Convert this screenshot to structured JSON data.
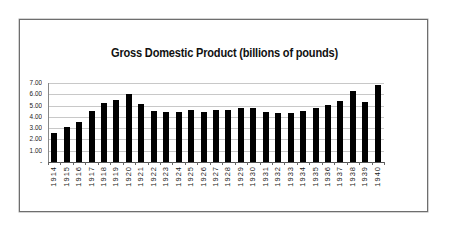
{
  "chart_data": {
    "type": "bar",
    "title": "Gross Domestic Product (billions of pounds)",
    "xlabel": "",
    "ylabel": "",
    "ylim": [
      0,
      7
    ],
    "grid": true,
    "legend": "none",
    "yticks": [
      "-",
      "1.00",
      "2.00",
      "3.00",
      "4.00",
      "5.00",
      "6.00",
      "7.00"
    ],
    "categories": [
      "1914",
      "1915",
      "1916",
      "1917",
      "1918",
      "1919",
      "1920",
      "1921",
      "1922",
      "1923",
      "1924",
      "1925",
      "1926",
      "1927",
      "1928",
      "1929",
      "1930",
      "1931",
      "1932",
      "1933",
      "1934",
      "1935",
      "1936",
      "1937",
      "1938",
      "1939",
      "1940"
    ],
    "values": [
      2.55,
      3.1,
      3.55,
      4.5,
      5.2,
      5.5,
      6.0,
      5.15,
      4.55,
      4.4,
      4.4,
      4.65,
      4.45,
      4.65,
      4.65,
      4.75,
      4.75,
      4.45,
      4.3,
      4.3,
      4.55,
      4.8,
      5.05,
      5.4,
      6.3,
      5.3,
      6.8
    ],
    "bar_color": "#000000"
  }
}
